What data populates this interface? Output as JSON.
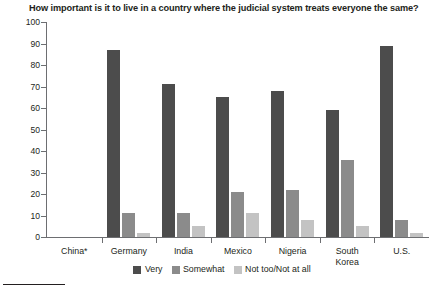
{
  "chart_data": {
    "type": "bar",
    "title": "How important is it to live in a country where the judicial system treats everyone the same?",
    "xlabel": "",
    "ylabel": "",
    "ylim": [
      0,
      100
    ],
    "yticks": [
      0,
      10,
      20,
      30,
      40,
      50,
      60,
      70,
      80,
      90,
      100
    ],
    "grid": false,
    "legend_position": "bottom",
    "categories": [
      "China*",
      "Germany",
      "India",
      "Mexico",
      "Nigeria",
      "South\nKorea",
      "U.S."
    ],
    "category_labels": [
      {
        "line1": "China*",
        "line2": ""
      },
      {
        "line1": "Germany",
        "line2": ""
      },
      {
        "line1": "India",
        "line2": ""
      },
      {
        "line1": "Mexico",
        "line2": ""
      },
      {
        "line1": "Nigeria",
        "line2": ""
      },
      {
        "line1": "South",
        "line2": "Korea"
      },
      {
        "line1": "U.S.",
        "line2": ""
      }
    ],
    "series": [
      {
        "name": "Very",
        "color": "#4c4c4c",
        "values": [
          null,
          87,
          71,
          65,
          68,
          59,
          89
        ]
      },
      {
        "name": "Somewhat",
        "color": "#8b8b8b",
        "values": [
          null,
          11,
          11,
          21,
          22,
          36,
          8
        ]
      },
      {
        "name": "Not too/Not at all",
        "color": "#c3c3c3",
        "values": [
          null,
          2,
          5,
          11,
          8,
          5,
          2
        ]
      }
    ]
  },
  "legend": {
    "items": [
      {
        "label": "Very",
        "color": "#4c4c4c"
      },
      {
        "label": "Somewhat",
        "color": "#8b8b8b"
      },
      {
        "label": "Not too/Not at all",
        "color": "#c3c3c3"
      }
    ]
  },
  "axis": {
    "y_labels": [
      "100",
      "90",
      "80",
      "70",
      "60",
      "50",
      "40",
      "30",
      "20",
      "10",
      "0"
    ]
  }
}
